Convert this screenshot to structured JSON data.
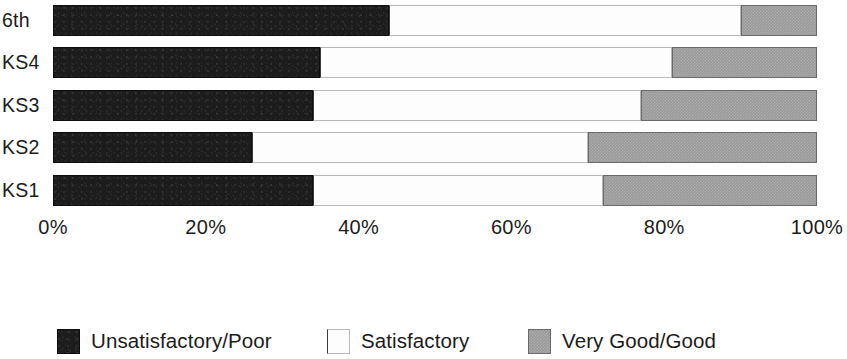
{
  "chart_data": {
    "type": "bar",
    "orientation": "horizontal",
    "stacked": true,
    "stack_mode": "percent",
    "title": "",
    "subtitle": "",
    "xlabel": "",
    "ylabel": "",
    "xlim": [
      0,
      100
    ],
    "grid": false,
    "legend_position": "bottom",
    "categories": [
      "6th",
      "KS4",
      "KS3",
      "KS2",
      "KS1"
    ],
    "tick_labels": [
      "0%",
      "20%",
      "40%",
      "60%",
      "80%",
      "100%"
    ],
    "tick_values": [
      0,
      20,
      40,
      60,
      80,
      100
    ],
    "series": [
      {
        "name": "Unsatisfactory/Poor",
        "color": "#1c1c1c",
        "values": [
          44,
          35,
          34,
          26,
          34
        ]
      },
      {
        "name": "Satisfactory",
        "color": "#fdfdfd",
        "values": [
          46,
          46,
          43,
          44,
          38
        ]
      },
      {
        "name": "Very Good/Good",
        "color": "#9a9a9a",
        "values": [
          10,
          19,
          23,
          30,
          28
        ]
      }
    ],
    "rows": [
      {
        "category": "6th",
        "poor": 44,
        "satisfactory": 46,
        "good": 10
      },
      {
        "category": "KS4",
        "poor": 35,
        "satisfactory": 46,
        "good": 19
      },
      {
        "category": "KS3",
        "poor": 34,
        "satisfactory": 43,
        "good": 23
      },
      {
        "category": "KS2",
        "poor": 26,
        "satisfactory": 44,
        "good": 30
      },
      {
        "category": "KS1",
        "poor": 34,
        "satisfactory": 38,
        "good": 28
      }
    ]
  },
  "legend": {
    "items": [
      {
        "label": "Unsatisfactory/Poor",
        "swatch": "black-swatch"
      },
      {
        "label": "Satisfactory",
        "swatch": "white-swatch"
      },
      {
        "label": "Very Good/Good",
        "swatch": "gray-swatch"
      }
    ]
  }
}
